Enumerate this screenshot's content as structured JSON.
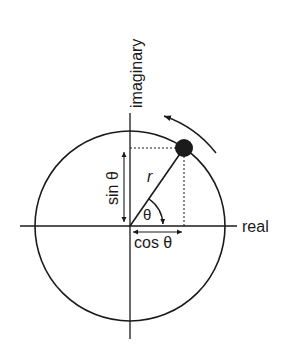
{
  "diagram": {
    "axes": {
      "horizontal_label": "real",
      "vertical_label": "imaginary"
    },
    "labels": {
      "radius": "r",
      "angle": "θ",
      "sine": "sin θ",
      "cosine": "cos θ"
    },
    "colors": {
      "stroke": "#1a1a1a",
      "dot": "#1a1a1a",
      "background": "#ffffff"
    }
  }
}
